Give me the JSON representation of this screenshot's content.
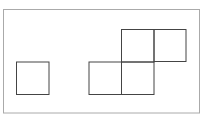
{
  "diagram": {
    "frame": {
      "x": 3.5,
      "y": 9.5,
      "w": 196,
      "h": 103.5,
      "stroke": "#aaaaaa"
    },
    "square_stroke": "#444444",
    "squares": [
      {
        "id": "left",
        "x": 16.5,
        "y": 62,
        "size": 32.5
      },
      {
        "id": "bottom-left",
        "x": 89,
        "y": 62,
        "size": 32.5
      },
      {
        "id": "bottom-middle",
        "x": 121.5,
        "y": 62,
        "size": 32.5
      },
      {
        "id": "top-middle",
        "x": 121.5,
        "y": 29.5,
        "size": 32.5
      },
      {
        "id": "top-right",
        "x": 154,
        "y": 29.5,
        "size": 32
      }
    ]
  }
}
